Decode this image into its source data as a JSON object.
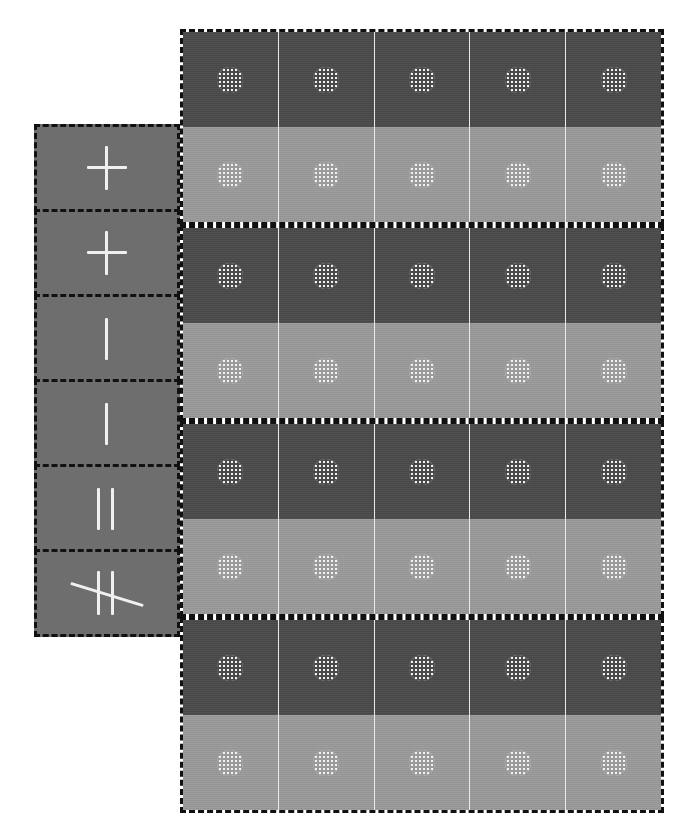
{
  "canvas": {
    "width": 683,
    "height": 822,
    "background": "#ffffff"
  },
  "colors": {
    "row_dark": "#4a4a4a",
    "row_light": "#9b9b9b",
    "sidebar_cell": "#6e6e6e",
    "dashed_border": "#111111",
    "cell_divider": "#e9e9e9",
    "marker_fill": "#f2f2f2",
    "glyph_stroke": "#f0f0f0"
  },
  "label_sidebar": {
    "name": "label-sidebar",
    "cell_count": 6,
    "cells": [
      {
        "index": 0,
        "glyph": "plus-icon",
        "symbol": "+",
        "glyph_class": "g-plus"
      },
      {
        "index": 1,
        "glyph": "plus-icon",
        "symbol": "+",
        "glyph_class": "g-plus"
      },
      {
        "index": 2,
        "glyph": "vertical-bar-icon",
        "symbol": "|",
        "glyph_class": "g-bar"
      },
      {
        "index": 3,
        "glyph": "vertical-bar-icon",
        "symbol": "|",
        "glyph_class": "g-bar"
      },
      {
        "index": 4,
        "glyph": "double-bar-icon",
        "symbol": "||",
        "glyph_class": "g-dbar"
      },
      {
        "index": 5,
        "glyph": "not-parallel-bar-icon",
        "symbol": "∦",
        "glyph_class": "g-nbar"
      }
    ]
  },
  "main_grid": {
    "name": "main-grid-panel",
    "columns": 5,
    "rows": 8,
    "marker_icon": "mesh-circle-icon",
    "groups": [
      {
        "index": 0,
        "rows": [
          {
            "index": 0,
            "tone": "dark",
            "color": "#4a4a4a",
            "cells": [
              "c1",
              "c2",
              "c3",
              "c4",
              "c5"
            ]
          },
          {
            "index": 1,
            "tone": "light",
            "color": "#9b9b9b",
            "cells": [
              "c1",
              "c2",
              "c3",
              "c4",
              "c5"
            ]
          }
        ]
      },
      {
        "index": 1,
        "rows": [
          {
            "index": 2,
            "tone": "dark",
            "color": "#4a4a4a",
            "cells": [
              "c1",
              "c2",
              "c3",
              "c4",
              "c5"
            ]
          },
          {
            "index": 3,
            "tone": "light",
            "color": "#9b9b9b",
            "cells": [
              "c1",
              "c2",
              "c3",
              "c4",
              "c5"
            ]
          }
        ]
      },
      {
        "index": 2,
        "rows": [
          {
            "index": 4,
            "tone": "dark",
            "color": "#4a4a4a",
            "cells": [
              "c1",
              "c2",
              "c3",
              "c4",
              "c5"
            ]
          },
          {
            "index": 5,
            "tone": "light",
            "color": "#9b9b9b",
            "cells": [
              "c1",
              "c2",
              "c3",
              "c4",
              "c5"
            ]
          }
        ]
      },
      {
        "index": 3,
        "rows": [
          {
            "index": 6,
            "tone": "dark",
            "color": "#4a4a4a",
            "cells": [
              "c1",
              "c2",
              "c3",
              "c4",
              "c5"
            ]
          },
          {
            "index": 7,
            "tone": "light",
            "color": "#9b9b9b",
            "cells": [
              "c1",
              "c2",
              "c3",
              "c4",
              "c5"
            ]
          }
        ]
      }
    ]
  }
}
